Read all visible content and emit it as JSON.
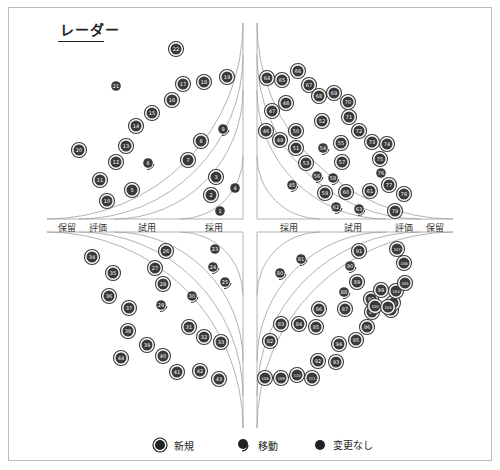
{
  "title": "レーダー",
  "rings": [
    "採用",
    "試用",
    "評価",
    "保留"
  ],
  "ring_labels_left": [
    "保留",
    "評価",
    "試用",
    "採用"
  ],
  "ring_labels_right": [
    "採用",
    "試用",
    "評価",
    "保留"
  ],
  "legend": [
    {
      "key": "new",
      "label": "新規",
      "icon": "double-ring-dot-icon"
    },
    {
      "key": "moved",
      "label": "移動",
      "icon": "moved-dot-icon"
    },
    {
      "key": "nochange",
      "label": "変更なし",
      "icon": "filled-dot-icon"
    }
  ],
  "colors": {
    "dot": "#3a3a3a",
    "line": "#9e9e9e",
    "text": "#222222",
    "dot_text": "#ffffff"
  },
  "chart_data": {
    "type": "scatter",
    "title": "レーダー",
    "rings": [
      "採用",
      "試用",
      "評価",
      "保留"
    ],
    "quadrants": [
      "top-left",
      "top-right",
      "bottom-left",
      "bottom-right"
    ],
    "status_legend": {
      "new": "新規",
      "moved": "移動",
      "nochange": "変更なし"
    },
    "blips": [
      {
        "id": 1,
        "x": 220,
        "y": 211,
        "status": "nochange"
      },
      {
        "id": 2,
        "x": 211,
        "y": 195,
        "status": "new"
      },
      {
        "id": 3,
        "x": 216,
        "y": 177,
        "status": "new"
      },
      {
        "id": 4,
        "x": 235,
        "y": 188,
        "status": "nochange"
      },
      {
        "id": 5,
        "x": 132,
        "y": 190,
        "status": "new"
      },
      {
        "id": 6,
        "x": 148,
        "y": 163,
        "status": "moved"
      },
      {
        "id": 7,
        "x": 188,
        "y": 160,
        "status": "new"
      },
      {
        "id": 8,
        "x": 201,
        "y": 141,
        "status": "new"
      },
      {
        "id": 9,
        "x": 223,
        "y": 129,
        "status": "moved"
      },
      {
        "id": 10,
        "x": 107,
        "y": 201,
        "status": "new"
      },
      {
        "id": 11,
        "x": 100,
        "y": 180,
        "status": "new"
      },
      {
        "id": 12,
        "x": 116,
        "y": 162,
        "status": "new"
      },
      {
        "id": 13,
        "x": 126,
        "y": 146,
        "status": "new"
      },
      {
        "id": 14,
        "x": 136,
        "y": 126,
        "status": "new"
      },
      {
        "id": 15,
        "x": 152,
        "y": 113,
        "status": "new"
      },
      {
        "id": 16,
        "x": 172,
        "y": 100,
        "status": "new"
      },
      {
        "id": 17,
        "x": 183,
        "y": 84,
        "status": "new"
      },
      {
        "id": 18,
        "x": 204,
        "y": 82,
        "status": "new"
      },
      {
        "id": 19,
        "x": 227,
        "y": 77,
        "status": "new"
      },
      {
        "id": 20,
        "x": 79,
        "y": 150,
        "status": "new"
      },
      {
        "id": 21,
        "x": 116,
        "y": 86,
        "status": "nochange"
      },
      {
        "id": 22,
        "x": 176,
        "y": 49,
        "status": "new"
      },
      {
        "id": 23,
        "x": 215,
        "y": 249,
        "status": "nochange"
      },
      {
        "id": 24,
        "x": 213,
        "y": 267,
        "status": "moved"
      },
      {
        "id": 25,
        "x": 225,
        "y": 282,
        "status": "moved"
      },
      {
        "id": 26,
        "x": 166,
        "y": 251,
        "status": "new"
      },
      {
        "id": 27,
        "x": 155,
        "y": 268,
        "status": "new"
      },
      {
        "id": 28,
        "x": 163,
        "y": 284,
        "status": "new"
      },
      {
        "id": 29,
        "x": 161,
        "y": 305,
        "status": "moved"
      },
      {
        "id": 30,
        "x": 192,
        "y": 296,
        "status": "moved"
      },
      {
        "id": 31,
        "x": 189,
        "y": 327,
        "status": "new"
      },
      {
        "id": 32,
        "x": 204,
        "y": 337,
        "status": "new"
      },
      {
        "id": 33,
        "x": 221,
        "y": 342,
        "status": "new"
      },
      {
        "id": 34,
        "x": 92,
        "y": 257,
        "status": "new"
      },
      {
        "id": 35,
        "x": 113,
        "y": 273,
        "status": "new"
      },
      {
        "id": 36,
        "x": 109,
        "y": 296,
        "status": "new"
      },
      {
        "id": 37,
        "x": 129,
        "y": 308,
        "status": "new"
      },
      {
        "id": 38,
        "x": 128,
        "y": 331,
        "status": "new"
      },
      {
        "id": 39,
        "x": 147,
        "y": 345,
        "status": "new"
      },
      {
        "id": 40,
        "x": 163,
        "y": 356,
        "status": "new"
      },
      {
        "id": 41,
        "x": 177,
        "y": 372,
        "status": "new"
      },
      {
        "id": 42,
        "x": 200,
        "y": 371,
        "status": "new"
      },
      {
        "id": 43,
        "x": 219,
        "y": 379,
        "status": "new"
      },
      {
        "id": 44,
        "x": 121,
        "y": 358,
        "status": "new"
      },
      {
        "id": 45,
        "x": 292,
        "y": 185,
        "status": "moved"
      },
      {
        "id": 46,
        "x": 266,
        "y": 131,
        "status": "new"
      },
      {
        "id": 47,
        "x": 272,
        "y": 111,
        "status": "new"
      },
      {
        "id": 48,
        "x": 286,
        "y": 103,
        "status": "new"
      },
      {
        "id": 49,
        "x": 280,
        "y": 140,
        "status": "new"
      },
      {
        "id": 50,
        "x": 296,
        "y": 131,
        "status": "new"
      },
      {
        "id": 51,
        "x": 296,
        "y": 148,
        "status": "new"
      },
      {
        "id": 52,
        "x": 322,
        "y": 121,
        "status": "new"
      },
      {
        "id": 53,
        "x": 306,
        "y": 163,
        "status": "new"
      },
      {
        "id": 54,
        "x": 323,
        "y": 148,
        "status": "moved"
      },
      {
        "id": 55,
        "x": 341,
        "y": 143,
        "status": "new"
      },
      {
        "id": 56,
        "x": 317,
        "y": 176,
        "status": "moved"
      },
      {
        "id": 57,
        "x": 342,
        "y": 162,
        "status": "new"
      },
      {
        "id": 58,
        "x": 333,
        "y": 178,
        "status": "moved"
      },
      {
        "id": 59,
        "x": 325,
        "y": 193,
        "status": "new"
      },
      {
        "id": 60,
        "x": 346,
        "y": 192,
        "status": "new"
      },
      {
        "id": 61,
        "x": 370,
        "y": 191,
        "status": "new"
      },
      {
        "id": 62,
        "x": 336,
        "y": 207,
        "status": "moved"
      },
      {
        "id": 63,
        "x": 359,
        "y": 209,
        "status": "moved"
      },
      {
        "id": 64,
        "x": 267,
        "y": 78,
        "status": "new"
      },
      {
        "id": 65,
        "x": 282,
        "y": 80,
        "status": "new"
      },
      {
        "id": 66,
        "x": 298,
        "y": 71,
        "status": "new"
      },
      {
        "id": 67,
        "x": 309,
        "y": 85,
        "status": "new"
      },
      {
        "id": 68,
        "x": 319,
        "y": 96,
        "status": "new"
      },
      {
        "id": 69,
        "x": 334,
        "y": 93,
        "status": "new"
      },
      {
        "id": 70,
        "x": 348,
        "y": 102,
        "status": "new"
      },
      {
        "id": 71,
        "x": 349,
        "y": 117,
        "status": "new"
      },
      {
        "id": 72,
        "x": 359,
        "y": 131,
        "status": "new"
      },
      {
        "id": 73,
        "x": 372,
        "y": 142,
        "status": "new"
      },
      {
        "id": 74,
        "x": 387,
        "y": 144,
        "status": "new"
      },
      {
        "id": 75,
        "x": 380,
        "y": 159,
        "status": "new"
      },
      {
        "id": 76,
        "x": 381,
        "y": 173,
        "status": "nochange"
      },
      {
        "id": 77,
        "x": 389,
        "y": 185,
        "status": "new"
      },
      {
        "id": 78,
        "x": 404,
        "y": 194,
        "status": "new"
      },
      {
        "id": 79,
        "x": 395,
        "y": 211,
        "status": "new"
      },
      {
        "id": 80,
        "x": 280,
        "y": 273,
        "status": "moved"
      },
      {
        "id": 81,
        "x": 301,
        "y": 259,
        "status": "moved"
      },
      {
        "id": 82,
        "x": 270,
        "y": 341,
        "status": "new"
      },
      {
        "id": 83,
        "x": 281,
        "y": 324,
        "status": "new"
      },
      {
        "id": 84,
        "x": 299,
        "y": 324,
        "status": "new"
      },
      {
        "id": 85,
        "x": 316,
        "y": 327,
        "status": "new"
      },
      {
        "id": 86,
        "x": 319,
        "y": 309,
        "status": "new"
      },
      {
        "id": 87,
        "x": 345,
        "y": 309,
        "status": "new"
      },
      {
        "id": 88,
        "x": 344,
        "y": 292,
        "status": "moved"
      },
      {
        "id": 89,
        "x": 357,
        "y": 282,
        "status": "new"
      },
      {
        "id": 90,
        "x": 350,
        "y": 266,
        "status": "moved"
      },
      {
        "id": 91,
        "x": 359,
        "y": 251,
        "status": "new"
      },
      {
        "id": 92,
        "x": 318,
        "y": 361,
        "status": "new"
      },
      {
        "id": 93,
        "x": 336,
        "y": 362,
        "status": "new"
      },
      {
        "id": 94,
        "x": 339,
        "y": 344,
        "status": "new"
      },
      {
        "id": 95,
        "x": 356,
        "y": 340,
        "status": "new"
      },
      {
        "id": 96,
        "x": 367,
        "y": 327,
        "status": "new"
      },
      {
        "id": 97,
        "x": 372,
        "y": 312,
        "status": "new"
      },
      {
        "id": 98,
        "x": 371,
        "y": 299,
        "status": "new"
      },
      {
        "id": 99,
        "x": 381,
        "y": 290,
        "status": "new"
      },
      {
        "id": 100,
        "x": 375,
        "y": 306,
        "status": "new"
      },
      {
        "id": 101,
        "x": 391,
        "y": 310,
        "status": "new"
      },
      {
        "id": 102,
        "x": 393,
        "y": 303,
        "status": "new"
      },
      {
        "id": 103,
        "x": 388,
        "y": 307,
        "status": "new"
      },
      {
        "id": 104,
        "x": 396,
        "y": 291,
        "status": "new"
      },
      {
        "id": 105,
        "x": 405,
        "y": 283,
        "status": "new"
      },
      {
        "id": 106,
        "x": 404,
        "y": 263,
        "status": "new"
      },
      {
        "id": 107,
        "x": 397,
        "y": 249,
        "status": "new"
      },
      {
        "id": 108,
        "x": 265,
        "y": 378,
        "status": "new"
      },
      {
        "id": 109,
        "x": 281,
        "y": 378,
        "status": "new"
      },
      {
        "id": 110,
        "x": 297,
        "y": 375,
        "status": "new"
      },
      {
        "id": 111,
        "x": 312,
        "y": 378,
        "status": "new"
      }
    ]
  }
}
